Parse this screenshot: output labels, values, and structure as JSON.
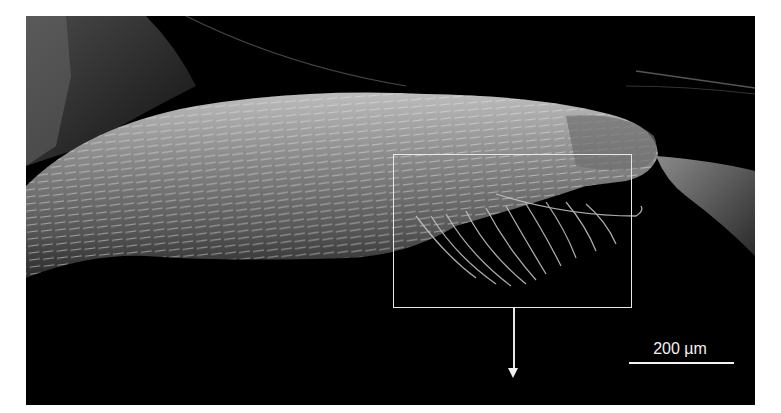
{
  "figure": {
    "type": "scanning electron micrograph",
    "inset_box": {
      "x": 393,
      "y": 154,
      "width": 240,
      "height": 155,
      "color": "#e8e8e8"
    },
    "arrow": {
      "direction": "down",
      "from_y": 309,
      "to_y": 381
    },
    "scale_bar": {
      "label": "200 µm",
      "color": "#f2f2f2"
    },
    "colors": {
      "background": "#000000",
      "frame": "#ffffff"
    }
  }
}
